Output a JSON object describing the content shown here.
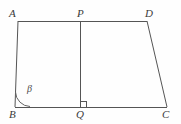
{
  "figure": {
    "type": "geometry-diagram",
    "canvas": {
      "width": 181,
      "height": 124
    },
    "stroke_color": "#555555",
    "background_color": "#fefefe",
    "stroke_width": 1
  },
  "points": {
    "A": {
      "label": "A",
      "x": 18,
      "y": 21,
      "label_x": 9,
      "label_y": 8
    },
    "P": {
      "label": "P",
      "x": 80,
      "y": 21,
      "label_x": 77,
      "label_y": 8
    },
    "D": {
      "label": "D",
      "x": 147,
      "y": 21,
      "label_x": 145,
      "label_y": 8
    },
    "B": {
      "label": "B",
      "x": 15,
      "y": 107,
      "label_x": 9,
      "label_y": 109
    },
    "Q": {
      "label": "Q",
      "x": 80,
      "y": 107,
      "label_x": 76,
      "label_y": 109
    },
    "C": {
      "label": "C",
      "x": 167,
      "y": 107,
      "label_x": 162,
      "label_y": 109
    }
  },
  "segments": [
    {
      "name": "AD",
      "from": "A",
      "to": "D"
    },
    {
      "name": "AB",
      "from": "A",
      "to": "B"
    },
    {
      "name": "BC",
      "from": "B",
      "to": "C"
    },
    {
      "name": "DC",
      "from": "D",
      "to": "C"
    },
    {
      "name": "PQ",
      "from": "P",
      "to": "Q"
    }
  ],
  "angles": {
    "beta": {
      "symbol": "β",
      "at_vertex": "B",
      "label_x": 27,
      "label_y": 84,
      "arc_radius": 15
    },
    "right_angle": {
      "at_vertex": "Q",
      "marker": "right-angle-square",
      "size": 6
    }
  }
}
